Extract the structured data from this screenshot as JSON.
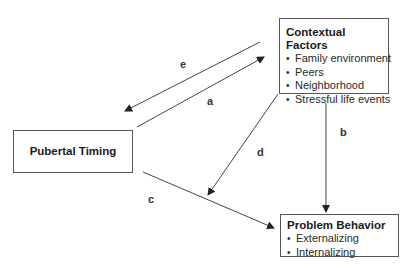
{
  "nodes": {
    "contextual_factors": {
      "title": "Contextual Factors",
      "items": [
        "Family environment",
        "Peers",
        "Neighborhood",
        "Stressful life events"
      ]
    },
    "pubertal_timing": {
      "title": "Pubertal Timing"
    },
    "problem_behavior": {
      "title": "Problem Behavior",
      "items": [
        "Externalizing",
        "Internalizing"
      ]
    }
  },
  "edges": {
    "a": {
      "label": "a",
      "from": "Pubertal Timing",
      "to": "Contextual Factors"
    },
    "b": {
      "label": "b",
      "from": "Contextual Factors",
      "to": "Problem Behavior"
    },
    "c": {
      "label": "c",
      "from": "Pubertal Timing",
      "to": "Problem Behavior"
    },
    "d": {
      "label": "d",
      "from": "Contextual Factors",
      "to": "path c (moderation)"
    },
    "e": {
      "label": "e",
      "from": "Contextual Factors",
      "to": "Pubertal Timing"
    }
  },
  "colors": {
    "line": "#444444",
    "text": "#1a1a1a",
    "background": "#ffffff"
  }
}
